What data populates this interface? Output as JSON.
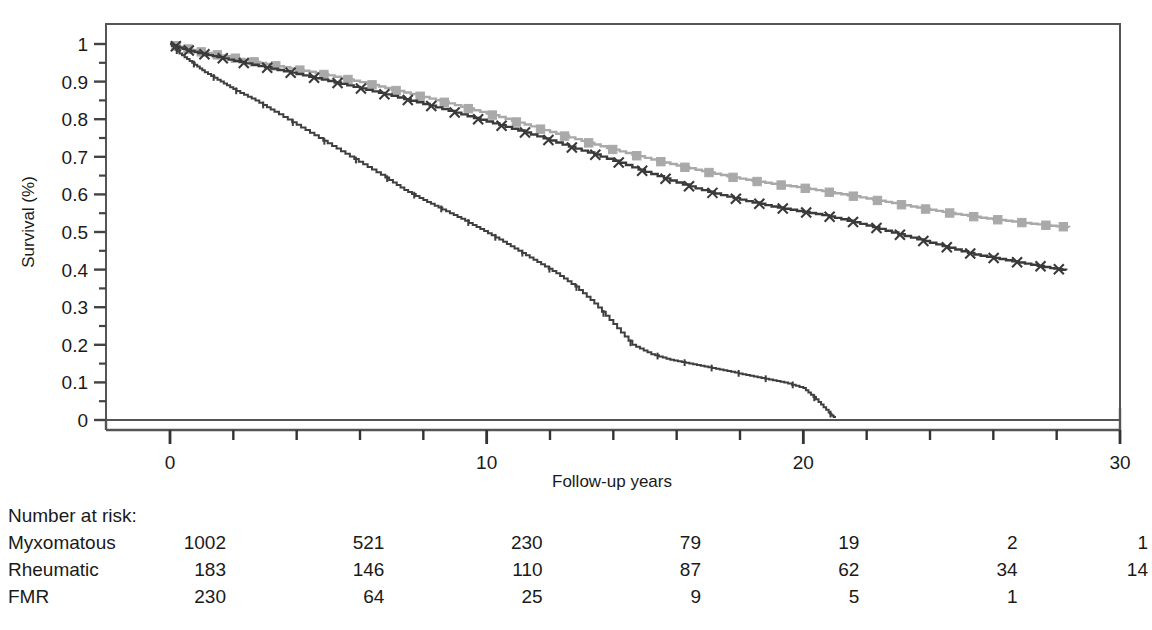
{
  "chart_data": {
    "type": "line",
    "title": "",
    "subtitle": "",
    "xlabel": "Follow-up years",
    "ylabel": "Survival (%)",
    "xlim": [
      0,
      30
    ],
    "ylim": [
      0,
      1
    ],
    "xticks": [
      0,
      10,
      20,
      30
    ],
    "xtick_labels": [
      "0",
      "10",
      "20",
      "30"
    ],
    "xminor_step": 2,
    "yticks": [
      0,
      0.1,
      0.2,
      0.3,
      0.4,
      0.5,
      0.6,
      0.7,
      0.8,
      0.9,
      1
    ],
    "ytick_labels": [
      "0",
      "0.1",
      "0.2",
      "0.3",
      "0.4",
      "0.5",
      "0.6",
      "0.7",
      "0.8",
      "0.9",
      "1"
    ],
    "grid": false,
    "legend": "none",
    "plot_kind": "kaplan-meier survival curves",
    "series": [
      {
        "name": "Myxomatous",
        "color": "#a9a9a9",
        "marker": "square",
        "censor_marker": "square",
        "x": [
          0,
          0.4,
          0.8,
          1.3,
          1.9,
          2.5,
          3.2,
          4.0,
          4.8,
          5.6,
          6.4,
          7.2,
          8.0,
          8.8,
          9.6,
          10.4,
          11.2,
          12.0,
          12.8,
          13.6,
          14.4,
          15.2,
          16.0,
          16.8,
          17.6,
          18.4,
          19.2,
          20.0,
          20.8,
          21.6,
          22.4,
          23.2,
          24.0,
          24.8,
          25.6,
          26.4,
          27.2,
          28.0,
          28.4
        ],
        "y": [
          1.0,
          0.99,
          0.982,
          0.974,
          0.965,
          0.955,
          0.944,
          0.932,
          0.92,
          0.906,
          0.891,
          0.875,
          0.859,
          0.842,
          0.824,
          0.806,
          0.786,
          0.766,
          0.747,
          0.728,
          0.71,
          0.693,
          0.677,
          0.662,
          0.648,
          0.636,
          0.626,
          0.617,
          0.606,
          0.595,
          0.583,
          0.571,
          0.559,
          0.548,
          0.538,
          0.53,
          0.522,
          0.515,
          0.513
        ]
      },
      {
        "name": "Rheumatic",
        "color": "#3a3a3a",
        "marker": "x",
        "censor_marker": "x",
        "x": [
          0,
          0.4,
          0.9,
          1.5,
          2.2,
          3.0,
          3.8,
          4.6,
          5.4,
          6.2,
          7.0,
          7.8,
          8.6,
          9.4,
          10.2,
          11.0,
          11.8,
          12.6,
          13.4,
          14.2,
          15.0,
          15.8,
          16.6,
          17.4,
          18.2,
          19.0,
          19.8,
          20.6,
          21.4,
          22.2,
          23.0,
          23.8,
          24.6,
          25.4,
          26.2,
          27.0,
          27.8,
          28.3
        ],
        "y": [
          1.0,
          0.987,
          0.976,
          0.965,
          0.952,
          0.938,
          0.924,
          0.909,
          0.894,
          0.878,
          0.862,
          0.845,
          0.827,
          0.808,
          0.789,
          0.77,
          0.749,
          0.727,
          0.706,
          0.684,
          0.66,
          0.637,
          0.616,
          0.598,
          0.582,
          0.568,
          0.556,
          0.545,
          0.53,
          0.513,
          0.494,
          0.476,
          0.458,
          0.44,
          0.428,
          0.416,
          0.404,
          0.398
        ]
      },
      {
        "name": "FMR",
        "color": "#3f3f3f",
        "marker": "tick",
        "censor_marker": "tick",
        "x": [
          0,
          0.3,
          0.7,
          1.1,
          1.6,
          2.1,
          2.7,
          3.3,
          4.0,
          4.7,
          5.4,
          6.1,
          6.8,
          7.4,
          8.0,
          8.6,
          9.2,
          9.8,
          10.4,
          11.0,
          11.6,
          12.2,
          12.8,
          13.4,
          14.0,
          14.6,
          15.2,
          15.8,
          16.4,
          17.0,
          17.6,
          18.2,
          18.8,
          19.4,
          20.0,
          20.4,
          20.8,
          21.0
        ],
        "y": [
          1.0,
          0.975,
          0.95,
          0.925,
          0.9,
          0.875,
          0.85,
          0.82,
          0.785,
          0.75,
          0.715,
          0.68,
          0.645,
          0.612,
          0.585,
          0.56,
          0.535,
          0.508,
          0.48,
          0.45,
          0.42,
          0.39,
          0.355,
          0.31,
          0.255,
          0.2,
          0.175,
          0.16,
          0.15,
          0.14,
          0.13,
          0.12,
          0.11,
          0.1,
          0.085,
          0.055,
          0.02,
          0.005
        ]
      }
    ]
  },
  "risk_table": {
    "header": "Number at risk:",
    "time_points": [
      0,
      5,
      10,
      15,
      20,
      25,
      30
    ],
    "rows": [
      {
        "label": "Myxomatous",
        "values": [
          "1002",
          "521",
          "230",
          "79",
          "19",
          "2",
          "1"
        ]
      },
      {
        "label": "Rheumatic",
        "values": [
          "183",
          "146",
          "110",
          "87",
          "62",
          "34",
          "14"
        ]
      },
      {
        "label": "FMR",
        "values": [
          "230",
          "64",
          "25",
          "9",
          "5",
          "1",
          ""
        ]
      }
    ]
  },
  "colors": {
    "axis": "#555555",
    "text": "#1a1a1a",
    "myxomatous": "#a9a9a9",
    "rheumatic": "#3a3a3a",
    "fmr": "#3f3f3f",
    "background": "#ffffff"
  }
}
